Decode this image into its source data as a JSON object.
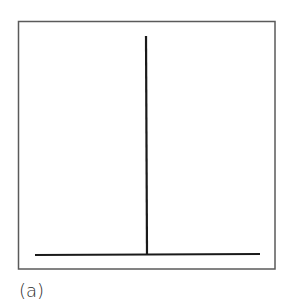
{
  "figure": {
    "caption": "(a)",
    "frame": {
      "x1": 18,
      "y1": 21,
      "x2": 275,
      "y2": 269,
      "color": "#555555"
    },
    "baseline": {
      "x1": 35,
      "y1": 255,
      "x2": 260,
      "y2": 254,
      "color": "#1a1a1a"
    },
    "stem": {
      "x1": 146,
      "y1": 36,
      "x2": 147,
      "y2": 255,
      "color": "#1a1a1a"
    }
  }
}
